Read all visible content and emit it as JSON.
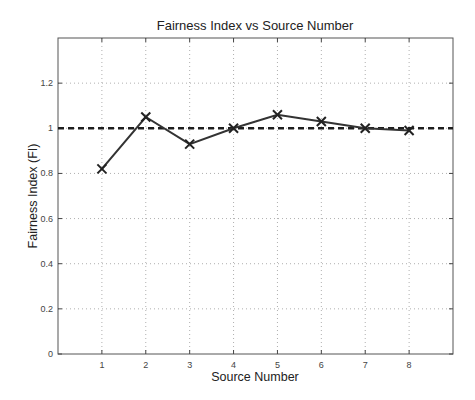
{
  "chart_data": {
    "type": "line",
    "title": "Fairness Index vs Source Number",
    "xlabel": "Source Number",
    "ylabel": "Fairness Index (FI)",
    "x": [
      1,
      2,
      3,
      4,
      5,
      6,
      7,
      8
    ],
    "series": [
      {
        "name": "Fairness Index",
        "values": [
          0.82,
          1.05,
          0.93,
          1.0,
          1.06,
          1.03,
          1.0,
          0.99
        ],
        "marker": "x",
        "line_style": "solid",
        "color": "#333333"
      },
      {
        "name": "Reference FI = 1",
        "values": [
          1,
          1,
          1,
          1,
          1,
          1,
          1,
          1
        ],
        "line_style": "dashed",
        "color": "#1e1e1e"
      }
    ],
    "xlim": [
      0,
      9
    ],
    "ylim": [
      0,
      1.4
    ],
    "xticks": [
      "1",
      "2",
      "3",
      "4",
      "5",
      "6",
      "7",
      "8"
    ],
    "yticks": [
      "0",
      "0.2",
      "0.4",
      "0.6",
      "0.8",
      "1",
      "1.2"
    ],
    "grid": true,
    "legend": null
  }
}
